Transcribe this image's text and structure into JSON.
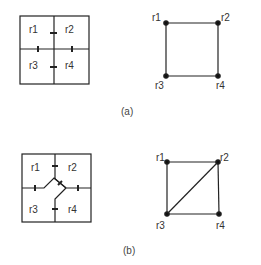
{
  "figure": {
    "panels": [
      {
        "caption": "(a)",
        "regions": {
          "r1": "r1",
          "r2": "r2",
          "r3": "r3",
          "r4": "r4"
        },
        "graph": {
          "nodes": [
            "r1",
            "r2",
            "r3",
            "r4"
          ],
          "edges": [
            [
              "r1",
              "r2"
            ],
            [
              "r1",
              "r3"
            ],
            [
              "r2",
              "r4"
            ],
            [
              "r3",
              "r4"
            ]
          ]
        }
      },
      {
        "caption": "(b)",
        "regions": {
          "r1": "r1",
          "r2": "r2",
          "r3": "r3",
          "r4": "r4"
        },
        "graph": {
          "nodes": [
            "r1",
            "r2",
            "r3",
            "r4"
          ],
          "edges": [
            [
              "r1",
              "r2"
            ],
            [
              "r1",
              "r3"
            ],
            [
              "r2",
              "r4"
            ],
            [
              "r3",
              "r4"
            ],
            [
              "r2",
              "r3"
            ]
          ]
        }
      }
    ],
    "colors": {
      "line": "#222222",
      "background": "#ffffff"
    }
  }
}
